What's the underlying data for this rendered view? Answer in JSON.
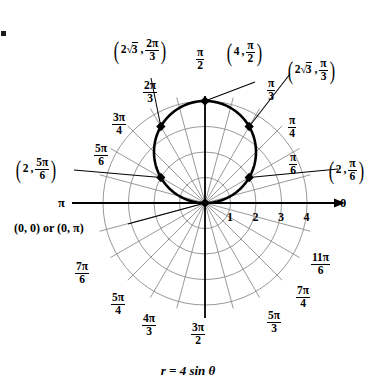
{
  "figure": {
    "caption": "r = 4 sin θ",
    "equation_r": "r",
    "equation_eq": "=",
    "equation_rhs": "4 sin θ",
    "polar_axis_label": "0",
    "pi_axis_label": "π",
    "pole_label": "(0, 0) or (0, π)",
    "radial_ticks": [
      "1",
      "2",
      "3",
      "4"
    ],
    "colors": {
      "curve": "#000000",
      "axis": "#000000",
      "grid": "#8d8d8d",
      "background": "#ffffff",
      "point": "#000000"
    }
  },
  "angle_labels": [
    {
      "name": "pi-over-6",
      "num": "π",
      "den": "6",
      "angle_deg": 30
    },
    {
      "name": "pi-over-4",
      "num": "π",
      "den": "4",
      "angle_deg": 45
    },
    {
      "name": "pi-over-3",
      "num": "π",
      "den": "3",
      "angle_deg": 60
    },
    {
      "name": "pi-over-2",
      "num": "π",
      "den": "2",
      "angle_deg": 90
    },
    {
      "name": "two-pi-over-3",
      "num": "2π",
      "den": "3",
      "angle_deg": 120
    },
    {
      "name": "three-pi-over-4",
      "num": "3π",
      "den": "4",
      "angle_deg": 135
    },
    {
      "name": "five-pi-over-6",
      "num": "5π",
      "den": "6",
      "angle_deg": 150
    },
    {
      "name": "seven-pi-over-6",
      "num": "7π",
      "den": "6",
      "angle_deg": 210
    },
    {
      "name": "five-pi-over-4",
      "num": "5π",
      "den": "4",
      "angle_deg": 225
    },
    {
      "name": "four-pi-over-3",
      "num": "4π",
      "den": "3",
      "angle_deg": 240
    },
    {
      "name": "three-pi-over-2",
      "num": "3π",
      "den": "2",
      "angle_deg": 270
    },
    {
      "name": "five-pi-over-3",
      "num": "5π",
      "den": "3",
      "angle_deg": 300
    },
    {
      "name": "seven-pi-over-4",
      "num": "7π",
      "den": "4",
      "angle_deg": 315
    },
    {
      "name": "eleven-pi-over-6",
      "num": "11π",
      "den": "6",
      "angle_deg": 330
    }
  ],
  "plotted_points": [
    {
      "name": "point-2sqrt3-2pi-3",
      "r_text": "2√3",
      "r_value": 3.4641,
      "theta_num": "2π",
      "theta_den": "3",
      "theta_deg": 120
    },
    {
      "name": "point-4-pi-2",
      "r_text": "4",
      "r_value": 4,
      "theta_num": "π",
      "theta_den": "2",
      "theta_deg": 90
    },
    {
      "name": "point-2sqrt3-pi-3",
      "r_text": "2√3",
      "r_value": 3.4641,
      "theta_num": "π",
      "theta_den": "3",
      "theta_deg": 60
    },
    {
      "name": "point-2-pi-6",
      "r_text": "2",
      "r_value": 2,
      "theta_num": "π",
      "theta_den": "6",
      "theta_deg": 30
    },
    {
      "name": "point-2-5pi-6",
      "r_text": "2",
      "r_value": 2,
      "theta_num": "5π",
      "theta_den": "6",
      "theta_deg": 150
    },
    {
      "name": "point-pole",
      "r_text": "0",
      "r_value": 0,
      "theta_num": "0",
      "theta_den": "",
      "theta_deg": 0
    }
  ],
  "chart_data": {
    "type": "line",
    "title": "r = 4 sin θ",
    "coordinate_system": "polar",
    "equation": "r = 4 sin(theta)",
    "xlabel": "0",
    "ylabel": "",
    "rlim": [
      0,
      4
    ],
    "r_ticks": [
      1,
      2,
      3,
      4
    ],
    "theta_grid_deg": [
      0,
      15,
      30,
      45,
      60,
      75,
      90,
      105,
      120,
      135,
      150,
      165,
      180,
      195,
      210,
      225,
      240,
      255,
      270,
      285,
      300,
      315,
      330,
      345
    ],
    "theta_labels": [
      "0",
      "π/6",
      "π/4",
      "π/3",
      "π/2",
      "2π/3",
      "3π/4",
      "5π/6",
      "π",
      "7π/6",
      "5π/4",
      "4π/3",
      "3π/2",
      "5π/3",
      "7π/4",
      "11π/6"
    ],
    "grid": true,
    "legend": "none",
    "series": [
      {
        "name": "r = 4 sin theta",
        "theta_deg": [
          0,
          30,
          45,
          60,
          90,
          120,
          135,
          150,
          180
        ],
        "r": [
          0,
          2,
          2.8284,
          3.4641,
          4,
          3.4641,
          2.8284,
          2,
          0
        ]
      }
    ],
    "annotations": [
      {
        "label": "(2√3, 2π/3)",
        "r": 3.4641,
        "theta_deg": 120
      },
      {
        "label": "(4, π/2)",
        "r": 4,
        "theta_deg": 90
      },
      {
        "label": "(2√3, π/3)",
        "r": 3.4641,
        "theta_deg": 60
      },
      {
        "label": "(2, π/6)",
        "r": 2,
        "theta_deg": 30
      },
      {
        "label": "(2, 5π/6)",
        "r": 2,
        "theta_deg": 150
      },
      {
        "label": "(0, 0) or (0, π)",
        "r": 0,
        "theta_deg": 0
      }
    ]
  }
}
